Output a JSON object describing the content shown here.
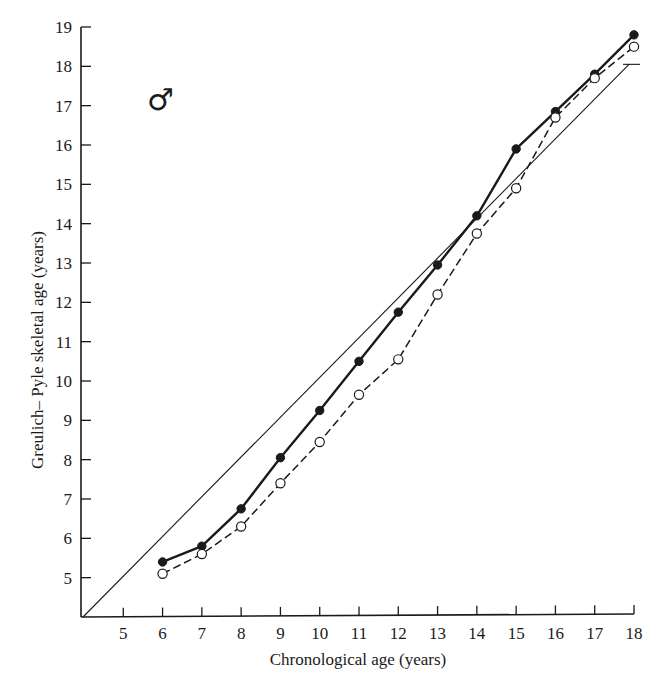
{
  "chart_data": {
    "type": "line",
    "title": "",
    "xlabel": "Chronological age (years)",
    "ylabel": "Greulich– Pyle skeletal age (years)",
    "xlim": [
      4,
      18
    ],
    "ylim": [
      4,
      19
    ],
    "x_ticks": [
      5,
      6,
      7,
      8,
      9,
      10,
      11,
      12,
      13,
      14,
      15,
      16,
      17,
      18
    ],
    "y_ticks": [
      5,
      6,
      7,
      8,
      9,
      10,
      11,
      12,
      13,
      14,
      15,
      16,
      17,
      18,
      19
    ],
    "grid": false,
    "legend": null,
    "annotations": [
      {
        "text": "♂",
        "meaning": "male symbol",
        "x": 6,
        "y": 17.1
      }
    ],
    "x": [
      6,
      7,
      8,
      9,
      10,
      11,
      12,
      13,
      14,
      15,
      16,
      17,
      18
    ],
    "series": [
      {
        "name": "filled circles (solid line)",
        "style": "solid",
        "marker": "filled-circle",
        "values": [
          5.4,
          5.8,
          6.75,
          8.05,
          9.25,
          10.5,
          11.75,
          12.95,
          14.2,
          15.9,
          16.85,
          17.8,
          18.8
        ]
      },
      {
        "name": "open circles (dashed line)",
        "style": "dashed",
        "marker": "open-circle",
        "values": [
          5.1,
          5.6,
          6.3,
          7.4,
          8.45,
          9.65,
          10.55,
          12.2,
          13.75,
          14.9,
          16.7,
          17.7,
          18.5
        ]
      },
      {
        "name": "identity line (skeletal age = chronological age)",
        "style": "thin-solid",
        "marker": "none",
        "points": [
          [
            4,
            4
          ],
          [
            18,
            18
          ]
        ]
      }
    ]
  },
  "labels": {
    "x_axis_title": "Chronological age (years)",
    "y_axis_title": "Greulich– Pyle skeletal age (years)",
    "sex_symbol": "♂"
  },
  "colors": {
    "ink": "#1a1a1a",
    "background": "#ffffff"
  }
}
